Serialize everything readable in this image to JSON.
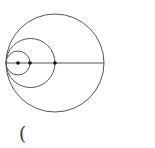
{
  "diagram": {
    "stroke_color": "#555555",
    "point_color": "#111111",
    "tangent_point": {
      "x": 6,
      "y": 63
    },
    "circles": [
      {
        "name": "small-circle",
        "cx": 18,
        "cy": 63,
        "r": 12
      },
      {
        "name": "middle-circle",
        "cx": 30.5,
        "cy": 63,
        "r": 24.5
      },
      {
        "name": "outer-circle",
        "cx": 55,
        "cy": 63,
        "r": 49
      }
    ],
    "line": {
      "x1": 6,
      "y1": 63,
      "x2": 104,
      "y2": 63
    },
    "points": [
      {
        "name": "point-1",
        "x": 18,
        "y": 63
      },
      {
        "name": "point-2",
        "x": 30,
        "y": 63
      },
      {
        "name": "point-3",
        "x": 55,
        "y": 63
      }
    ]
  },
  "caption": {
    "text": "("
  }
}
